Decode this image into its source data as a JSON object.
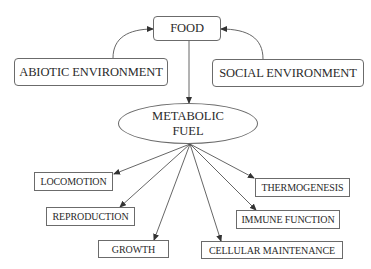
{
  "diagram": {
    "type": "flow",
    "nodes": {
      "food": {
        "label": "FOOD"
      },
      "abiotic": {
        "label": "ABIOTIC ENVIRONMENT"
      },
      "social": {
        "label": "SOCIAL ENVIRONMENT"
      },
      "fuel": {
        "line1": "METABOLIC",
        "line2": "FUEL"
      },
      "locomotion": {
        "label": "LOCOMOTION"
      },
      "reproduction": {
        "label": "REPRODUCTION"
      },
      "growth": {
        "label": "GROWTH"
      },
      "cellular": {
        "label": "CELLULAR MAINTENANCE"
      },
      "immune": {
        "label": "IMMUNE FUNCTION"
      },
      "thermo": {
        "label": "THERMOGENESIS"
      }
    },
    "edges": [
      {
        "from": "ABIOTIC ENVIRONMENT",
        "to": "FOOD"
      },
      {
        "from": "SOCIAL ENVIRONMENT",
        "to": "FOOD"
      },
      {
        "from": "FOOD",
        "to": "METABOLIC FUEL"
      },
      {
        "from": "METABOLIC FUEL",
        "to": "LOCOMOTION"
      },
      {
        "from": "METABOLIC FUEL",
        "to": "REPRODUCTION"
      },
      {
        "from": "METABOLIC FUEL",
        "to": "GROWTH"
      },
      {
        "from": "METABOLIC FUEL",
        "to": "CELLULAR MAINTENANCE"
      },
      {
        "from": "METABOLIC FUEL",
        "to": "IMMUNE FUNCTION"
      },
      {
        "from": "METABOLIC FUEL",
        "to": "THERMOGENESIS"
      }
    ],
    "colors": {
      "stroke": "#6b6b6b",
      "text": "#2a2a2a",
      "background": "#ffffff"
    }
  }
}
